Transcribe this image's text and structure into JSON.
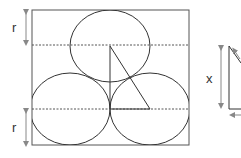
{
  "diagram": {
    "labels": {
      "radius_top": "r",
      "radius_bottom": "r",
      "height_x": "x"
    },
    "colors": {
      "stroke": "#333333",
      "dashed": "#555555",
      "arrow": "#888888",
      "background": "#ffffff"
    },
    "shapes": {
      "square": {
        "x": 32,
        "y": 10,
        "width": 157,
        "height": 135
      },
      "circles": [
        {
          "name": "top-circle",
          "cx": 110,
          "cy": 46,
          "r": 36
        },
        {
          "name": "bottom-left-circle",
          "cx": 70,
          "cy": 109,
          "r": 38
        },
        {
          "name": "bottom-right-circle",
          "cx": 150,
          "cy": 109,
          "r": 38
        }
      ],
      "dashed_lines_y": [
        45,
        109
      ],
      "triangle": {
        "top": [
          110,
          46
        ],
        "bottom_left": [
          110,
          109
        ],
        "bottom_right": [
          150,
          109
        ]
      }
    }
  }
}
